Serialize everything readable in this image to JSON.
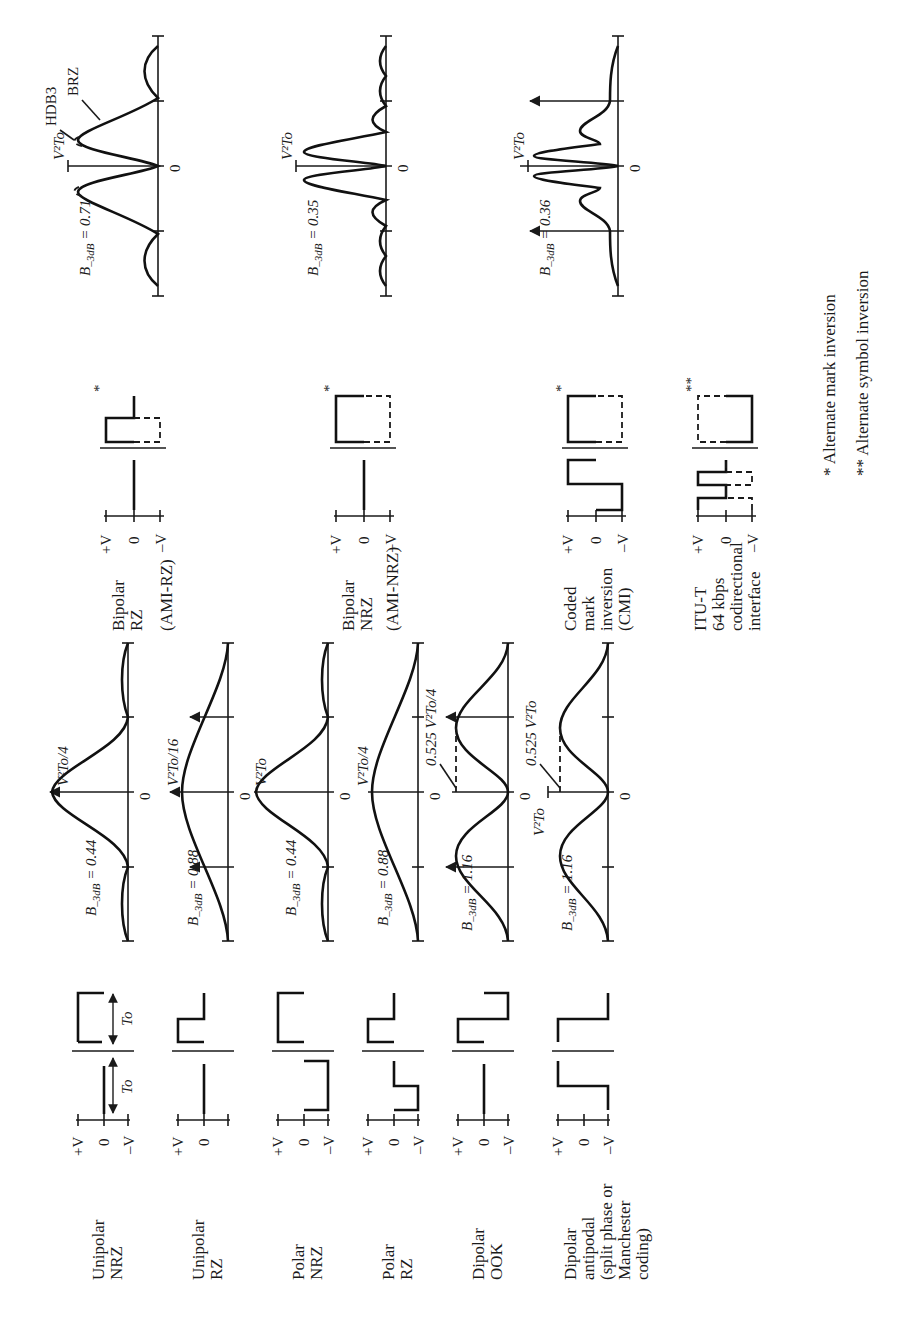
{
  "figure": {
    "orientation": "rotated 90 degrees counter-clockwise",
    "left_column": [
      {
        "name": "Unipolar NRZ",
        "label_lines": [
          "Unipolar",
          "NRZ"
        ],
        "bandwidth": "B– 3dB = 0.44/To",
        "bw_num": "0.44",
        "peak": "V²To/4",
        "peak_num": "V²To",
        "peak_den": "4",
        "period_label": "To"
      },
      {
        "name": "Unipolar RZ",
        "label_lines": [
          "Unipolar",
          "RZ"
        ],
        "bandwidth": "B– 3dB = 0.88/To",
        "bw_num": "0.88",
        "peak": "V²To/16",
        "peak_num": "V²To",
        "peak_den": "16"
      },
      {
        "name": "Polar NRZ",
        "label_lines": [
          "Polar",
          "NRZ"
        ],
        "bandwidth": "B– 3dB = 0.44/To",
        "bw_num": "0.44",
        "peak": "V²To",
        "peak_num": "V²To",
        "peak_den": ""
      },
      {
        "name": "Polar RZ",
        "label_lines": [
          "Polar",
          "RZ"
        ],
        "bandwidth": "B– 3dB = 0.88/To",
        "bw_num": "0.88",
        "peak": "V²To/4",
        "peak_num": "V²To",
        "peak_den": "4"
      },
      {
        "name": "Dipolar OOK",
        "label_lines": [
          "Dipolar",
          "OOK"
        ],
        "bandwidth": "B– 3dB = 1.16/To",
        "bw_num": "1.16",
        "peak": "0.525 V²To/4",
        "annot": "0.525",
        "annot_num": "V²To",
        "annot_den": "4"
      },
      {
        "name": "Dipolar antipodal",
        "label_lines": [
          "Dipolar",
          "antipodal",
          "(split phase or",
          "Manchester",
          "coding)"
        ],
        "bandwidth": "B– 3dB = 1.16/To",
        "bw_num": "1.16",
        "peak": "V²To",
        "peak_num": "V²To",
        "annot": "0.525 V²To"
      }
    ],
    "right_column": [
      {
        "name": "Bipolar RZ (AMI-RZ)",
        "label_lines": [
          "Bipolar",
          "RZ",
          "(AMI-RZ)"
        ],
        "marker": "*",
        "bandwidth": "B– 3dB = 0.71/To",
        "bw_num": "0.71",
        "peak_num": "V²To",
        "peak_den": "4",
        "curve_labels": [
          "HDB3",
          "BRZ"
        ]
      },
      {
        "name": "Bipolar NRZ (AMI-NRZ)",
        "label_lines": [
          "Bipolar",
          "NRZ",
          "(AMI-NRZ)"
        ],
        "marker": "*",
        "bandwidth": "B– 3dB = 0.35/To",
        "bw_num": "0.35",
        "peak_num": "V²To"
      },
      {
        "name": "Coded mark inversion (CMI)",
        "label_lines": [
          "Coded",
          "mark",
          "inversion",
          "(CMI)"
        ],
        "marker": "*",
        "bandwidth": "B– 3dB = 0.36/To",
        "bw_num": "0.36",
        "peak_num": "V²To"
      },
      {
        "name": "ITU-T 64 kbps codirectional interface",
        "label_lines": [
          "ITU-T",
          "64 kbps",
          "codirectional",
          "interface"
        ],
        "marker": "**"
      }
    ],
    "level_labels": {
      "plus_v": "+V",
      "zero": "0",
      "minus_v": "–V"
    },
    "freq_ticks": {
      "neg2": "2",
      "neg1": "1",
      "zero": "0",
      "pos1": "1",
      "pos2": "2",
      "den": "To",
      "minus": "–"
    },
    "bw_prefix": "B",
    "bw_sub": "–3dB",
    "bw_eq": "=",
    "bw_den": "To",
    "footnotes": [
      "* Alternate mark inversion",
      "** Alternate symbol inversion"
    ]
  }
}
